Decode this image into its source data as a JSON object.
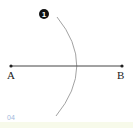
{
  "diagram": {
    "step_badge": "1",
    "points": [
      {
        "label": "A"
      },
      {
        "label": "B"
      }
    ],
    "page_number": "04"
  },
  "colors": {
    "line": "#333333",
    "arc": "#8a8a8a",
    "badge": "#111111",
    "page_number": "#9fb8dc"
  }
}
